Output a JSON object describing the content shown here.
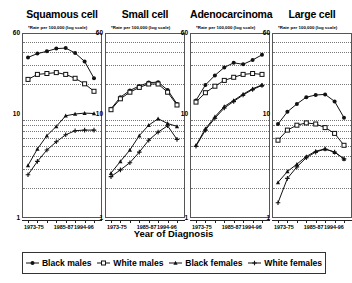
{
  "chart_data": {
    "type": "line",
    "title": "",
    "xlabel": "Year of Diagnosis",
    "ylabel": "Rate per 100,000 (log scale)",
    "ylabel_footnote": "*",
    "yscale": "log",
    "ylim": [
      1,
      60
    ],
    "yticks": [
      1,
      10,
      60
    ],
    "ytick_labels": [
      "1",
      "10",
      "60"
    ],
    "gridlines": "horizontal dotted at log minor ticks",
    "legend_position": "bottom",
    "x": [
      "1973-75",
      "1976-78",
      "1979-81",
      "1982-84",
      "1985-87",
      "1988-90",
      "1991-93",
      "1994-96"
    ],
    "xtick_labels": [
      "1973-75",
      "1985-87",
      "1994-96"
    ],
    "legend": [
      {
        "name": "Black males",
        "marker": "filled-circle",
        "color": "#111111"
      },
      {
        "name": "White males",
        "marker": "open-square",
        "color": "#111111"
      },
      {
        "name": "Black females",
        "marker": "filled-triangle",
        "color": "#111111"
      },
      {
        "name": "White females",
        "marker": "plus",
        "color": "#111111"
      }
    ],
    "panels": [
      {
        "title": "Squamous cell",
        "series": [
          {
            "name": "Black males",
            "values": [
              35.0,
              38.0,
              40.0,
              42.5,
              43.0,
              38.5,
              32.0,
              22.0
            ]
          },
          {
            "name": "White males",
            "values": [
              21.5,
              24.0,
              24.5,
              25.0,
              24.0,
              22.0,
              19.5,
              16.5
            ]
          },
          {
            "name": "Black females",
            "values": [
              3.2,
              4.6,
              6.2,
              7.6,
              9.6,
              10.0,
              10.2,
              10.1
            ]
          },
          {
            "name": "White females",
            "values": [
              2.6,
              3.5,
              4.5,
              5.4,
              6.3,
              6.9,
              7.0,
              7.0
            ]
          }
        ]
      },
      {
        "title": "Small cell",
        "series": [
          {
            "name": "Black males",
            "values": [
              11.2,
              14.5,
              16.8,
              18.6,
              20.0,
              20.2,
              17.0,
              12.5
            ]
          },
          {
            "name": "White males",
            "values": [
              11.0,
              14.0,
              16.2,
              18.0,
              19.4,
              19.4,
              16.2,
              12.2
            ]
          },
          {
            "name": "Black females",
            "values": [
              2.7,
              3.5,
              4.5,
              6.2,
              7.8,
              9.0,
              8.1,
              7.6
            ]
          },
          {
            "name": "White females",
            "values": [
              2.5,
              2.9,
              3.4,
              4.3,
              5.6,
              6.7,
              7.7,
              5.7
            ]
          }
        ]
      },
      {
        "title": "Adenocarcinoma",
        "series": [
          {
            "name": "Black males",
            "values": [
              13.5,
              19.0,
              23.5,
              28.0,
              31.0,
              30.0,
              33.0,
              37.0
            ]
          },
          {
            "name": "White males",
            "values": [
              13.0,
              16.0,
              18.5,
              21.0,
              22.5,
              24.0,
              24.5,
              24.0
            ]
          },
          {
            "name": "Black females",
            "values": [
              5.0,
              7.2,
              9.4,
              11.8,
              13.5,
              15.5,
              17.5,
              19.0
            ]
          },
          {
            "name": "White females",
            "values": [
              4.9,
              7.0,
              9.1,
              11.4,
              13.2,
              15.2,
              17.2,
              18.8
            ]
          }
        ]
      },
      {
        "title": "Large cell",
        "series": [
          {
            "name": "Black males",
            "values": [
              8.0,
              10.5,
              12.5,
              14.5,
              15.2,
              15.4,
              13.2,
              9.2
            ]
          },
          {
            "name": "White males",
            "values": [
              5.6,
              7.0,
              7.8,
              8.2,
              8.0,
              7.4,
              6.5,
              5.0
            ]
          },
          {
            "name": "Black females",
            "values": [
              2.2,
              2.8,
              3.3,
              3.9,
              4.4,
              4.6,
              4.3,
              3.7
            ]
          },
          {
            "name": "White females",
            "values": [
              1.4,
              2.4,
              3.1,
              3.8,
              4.3,
              4.6,
              4.3,
              3.7
            ]
          }
        ]
      }
    ]
  }
}
